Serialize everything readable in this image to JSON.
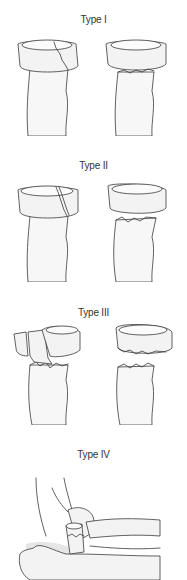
{
  "figure": {
    "panels": [
      {
        "label": "Type I",
        "description": "Non-displaced radial head fracture"
      },
      {
        "label": "Type II",
        "description": "Minimally displaced radial head fracture"
      },
      {
        "label": "Type III",
        "description": "Comminuted radial head fracture"
      },
      {
        "label": "Type IV",
        "description": "Radial head fracture with elbow dislocation"
      }
    ],
    "colors": {
      "background": "#ffffff",
      "line": "#3a3a3a",
      "bone_fill": "#f3f3f3"
    }
  }
}
